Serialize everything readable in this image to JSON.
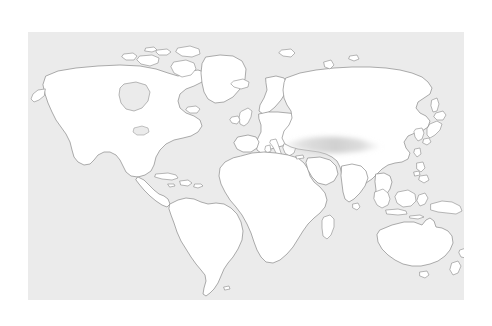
{
  "figure": {
    "kind": "world-map",
    "canvas": {
      "width": 492,
      "height": 326
    },
    "background_color": "#ffffff"
  },
  "map": {
    "panel": {
      "x": 28,
      "y": 32,
      "width": 436,
      "height": 268,
      "ocean_color": "#ebebeb",
      "land_fill_color": "#ffffff",
      "coastline_color": "#8a8a8a",
      "coastline_width": 0.7
    },
    "projection_note": "equirectangular-style world outline",
    "labels_visible": false,
    "graticule_visible": false,
    "legend_visible": false,
    "regions": [
      {
        "name": "north-america",
        "label": "North America"
      },
      {
        "name": "greenland",
        "label": "Greenland"
      },
      {
        "name": "canadian-arctic-archipelago",
        "label": "Canadian Arctic Archipelago"
      },
      {
        "name": "central-america",
        "label": "Central America"
      },
      {
        "name": "caribbean-islands",
        "label": "Caribbean Islands"
      },
      {
        "name": "south-america",
        "label": "South America"
      },
      {
        "name": "iceland",
        "label": "Iceland"
      },
      {
        "name": "british-isles",
        "label": "British Isles"
      },
      {
        "name": "scandinavia",
        "label": "Scandinavia"
      },
      {
        "name": "europe",
        "label": "Europe"
      },
      {
        "name": "africa",
        "label": "Africa"
      },
      {
        "name": "madagascar",
        "label": "Madagascar"
      },
      {
        "name": "arabia",
        "label": "Arabian Peninsula"
      },
      {
        "name": "asia",
        "label": "Asia"
      },
      {
        "name": "india",
        "label": "India"
      },
      {
        "name": "sri-lanka",
        "label": "Sri Lanka"
      },
      {
        "name": "japan",
        "label": "Japan"
      },
      {
        "name": "philippines",
        "label": "Philippines"
      },
      {
        "name": "indonesia",
        "label": "Indonesia"
      },
      {
        "name": "new-guinea",
        "label": "New Guinea"
      },
      {
        "name": "australia",
        "label": "Australia"
      },
      {
        "name": "tasmania",
        "label": "Tasmania"
      },
      {
        "name": "new-zealand",
        "label": "New Zealand"
      }
    ]
  },
  "highlight": {
    "name": "central-asia-highlight",
    "shape": "blurred-lens-ellipse",
    "color": "#d4d4d4",
    "opacity": 0.85,
    "blur_px": 3,
    "x": 250,
    "y": 96,
    "width": 78,
    "height": 18,
    "description": "Soft grey lens-shaped smudge over Central Asia"
  }
}
